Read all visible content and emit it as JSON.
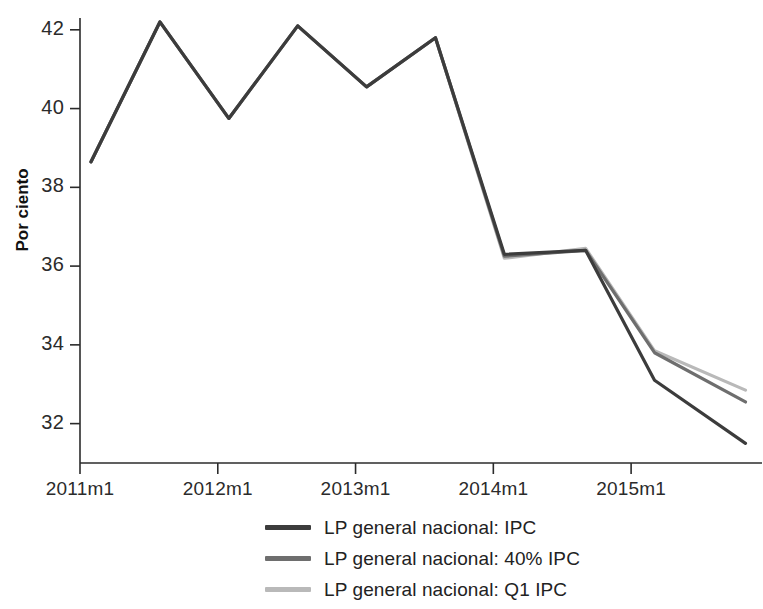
{
  "chart_data": {
    "type": "line",
    "title": "",
    "xlabel": "",
    "ylabel": "Por ciento",
    "ylim": [
      31.0,
      42.3
    ],
    "xlim": [
      2011.0,
      2015.95
    ],
    "grid": false,
    "legend_position": "bottom",
    "yticks": [
      "32",
      "34",
      "36",
      "38",
      "40",
      "42"
    ],
    "ytick_values": [
      32,
      34,
      36,
      38,
      40,
      42
    ],
    "xticks": [
      "2011m1",
      "2012m1",
      "2013m1",
      "2014m1",
      "2015m1"
    ],
    "xtick_values": [
      2011.0,
      2012.0,
      2013.0,
      2014.0,
      2015.0
    ],
    "x": [
      2011.08,
      2011.58,
      2012.08,
      2012.58,
      2013.08,
      2013.58,
      2014.08,
      2014.67,
      2015.17,
      2015.83
    ],
    "series": [
      {
        "name": "LP general nacional: IPC",
        "color": "#3c3c3c",
        "values": [
          38.65,
          42.2,
          39.75,
          42.1,
          40.55,
          41.8,
          36.3,
          36.4,
          33.1,
          31.5
        ]
      },
      {
        "name": "LP general nacional: 40% IPC",
        "color": "#6e6e6e",
        "values": [
          38.65,
          42.2,
          39.75,
          42.1,
          40.55,
          41.8,
          36.25,
          36.4,
          33.8,
          32.55
        ]
      },
      {
        "name": "LP general nacional: Q1 IPC",
        "color": "#b9b9b9",
        "values": [
          38.65,
          42.2,
          39.75,
          42.1,
          40.55,
          41.8,
          36.2,
          36.45,
          33.85,
          32.85
        ]
      }
    ]
  },
  "legend": {
    "items": [
      {
        "label": "LP general nacional: IPC",
        "color": "#3c3c3c"
      },
      {
        "label": "LP general nacional: 40% IPC",
        "color": "#6e6e6e"
      },
      {
        "label": "LP general nacional: Q1 IPC",
        "color": "#b9b9b9"
      }
    ]
  }
}
